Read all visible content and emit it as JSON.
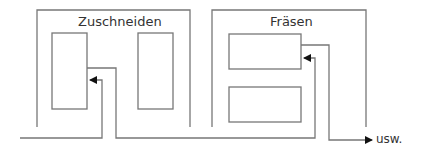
{
  "diagram": {
    "stations": [
      {
        "id": "zuschneiden",
        "title": "Zuschneiden",
        "machines": 2
      },
      {
        "id": "fraesen",
        "title": "Fräsen",
        "machines": 2
      }
    ],
    "continuation_label": "usw.",
    "colors": {
      "line": "#777777",
      "arrow": "#111111",
      "text": "#333333"
    }
  }
}
